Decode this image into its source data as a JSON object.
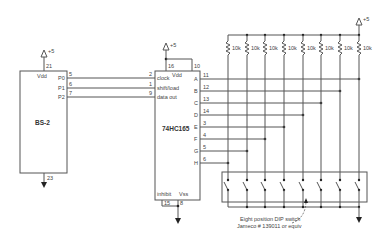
{
  "diagram": {
    "type": "schematic",
    "supply_label": "+5",
    "bs2": {
      "name": "BS-2",
      "vdd_label": "Vdd",
      "vdd_pin": "21",
      "gnd_pin": "23",
      "pins": [
        {
          "label": "P0",
          "num": "5"
        },
        {
          "label": "P1",
          "num": "6"
        },
        {
          "label": "P2",
          "num": "7"
        }
      ]
    },
    "shift_reg": {
      "name": "74HC165",
      "vdd_label": "Vdd",
      "vdd_pin": "16",
      "pin10": "10",
      "inputs": [
        {
          "label": "clock",
          "num": "2"
        },
        {
          "label": "shift/load",
          "num": "1"
        },
        {
          "label": "data out",
          "num": "9"
        }
      ],
      "outputs": [
        {
          "label": "A",
          "num": "11"
        },
        {
          "label": "B",
          "num": "12"
        },
        {
          "label": "C",
          "num": "13"
        },
        {
          "label": "D",
          "num": "14"
        },
        {
          "label": "E",
          "num": "3"
        },
        {
          "label": "F",
          "num": "4"
        },
        {
          "label": "G",
          "num": "5"
        },
        {
          "label": "H",
          "num": "6"
        }
      ],
      "inhibit_label": "inhibit",
      "inhibit_pin": "15",
      "vss_label": "Vss",
      "vss_pin": "8"
    },
    "resistors": [
      "10k",
      "10k",
      "10k",
      "10k",
      "10k",
      "10k",
      "10k",
      "10k"
    ],
    "dip_note_line1": "Eight position DIP switch",
    "dip_note_line2": "Jameco # 139011 or equiv"
  }
}
